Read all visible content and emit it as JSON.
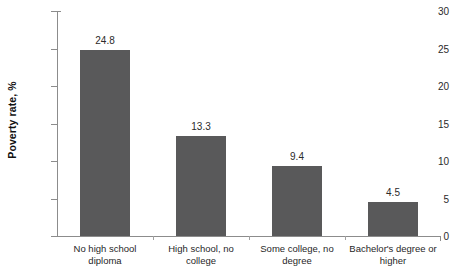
{
  "chart_data": {
    "type": "bar",
    "title": "",
    "subtitle": "",
    "xlabel": "",
    "ylabel": "Poverty rate, %",
    "categories": [
      "No high school diploma",
      "High school, no college",
      "Some college, no degree",
      "Bachelor's degree or higher"
    ],
    "category_lines": [
      [
        "No high school",
        "diploma"
      ],
      [
        "High school, no",
        "college"
      ],
      [
        "Some college, no",
        "degree"
      ],
      [
        "Bachelor's degree or",
        "higher"
      ]
    ],
    "values": [
      24.8,
      13.3,
      9.4,
      4.5
    ],
    "value_labels": [
      "24.8",
      "13.3",
      "9.4",
      "4.5"
    ],
    "ylim": [
      0,
      30
    ],
    "yticks": [
      0,
      5,
      10,
      15,
      20,
      25,
      30
    ],
    "ytick_labels": [
      "0",
      "5",
      "10",
      "15",
      "20",
      "25",
      "30"
    ],
    "grid": false,
    "legend": false,
    "legend_position": "none",
    "bar_color": "#59595a",
    "axis_color": "#8c8c8c",
    "text_color": "#1f1f1f",
    "background_color": "#ffffff"
  }
}
